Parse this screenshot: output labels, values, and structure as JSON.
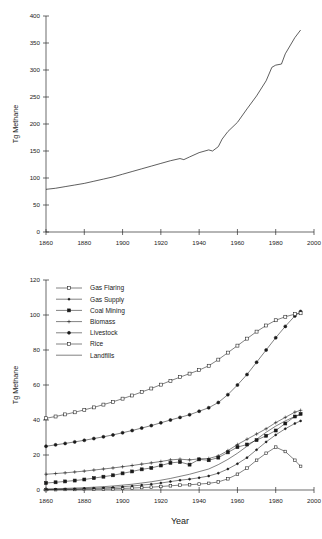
{
  "figure": {
    "axis_title_y": "Tg Methane",
    "axis_title_x": "Year"
  },
  "chart_data": [
    {
      "type": "line",
      "title": "",
      "xlabel": "",
      "ylabel": "Tg Methane",
      "xlim": [
        1860,
        2000
      ],
      "ylim": [
        0,
        400
      ],
      "xticks": [
        1860,
        1880,
        1900,
        1920,
        1940,
        1960,
        1980,
        2000
      ],
      "yticks": [
        0,
        50,
        100,
        150,
        200,
        250,
        300,
        350,
        400
      ],
      "grid": false,
      "legend": "none",
      "series": [
        {
          "name": "Total anthropogenic methane",
          "x": [
            1860,
            1865,
            1870,
            1875,
            1880,
            1885,
            1890,
            1895,
            1900,
            1905,
            1910,
            1915,
            1920,
            1925,
            1930,
            1932,
            1935,
            1940,
            1945,
            1947,
            1950,
            1952,
            1955,
            1960,
            1965,
            1970,
            1975,
            1978,
            1980,
            1983,
            1985,
            1990,
            1993
          ],
          "values": [
            79,
            81,
            84,
            87,
            90,
            94,
            98,
            102,
            107,
            112,
            117,
            122,
            127,
            132,
            136,
            134,
            139,
            147,
            152,
            150,
            158,
            172,
            186,
            203,
            228,
            252,
            280,
            305,
            309,
            311,
            330,
            360,
            374
          ]
        }
      ]
    },
    {
      "type": "line",
      "title": "",
      "xlabel": "Year",
      "ylabel": "Tg Methane",
      "xlim": [
        1860,
        2000
      ],
      "ylim": [
        0,
        120
      ],
      "xticks": [
        1860,
        1880,
        1900,
        1920,
        1940,
        1960,
        1980,
        2000
      ],
      "yticks": [
        0,
        20,
        40,
        60,
        80,
        100,
        120
      ],
      "grid": false,
      "legend": "upper left",
      "categories": [
        1860,
        1865,
        1870,
        1875,
        1880,
        1885,
        1890,
        1895,
        1900,
        1905,
        1910,
        1915,
        1920,
        1925,
        1930,
        1935,
        1940,
        1945,
        1950,
        1955,
        1960,
        1965,
        1970,
        1975,
        1980,
        1985,
        1990,
        1993
      ],
      "series": [
        {
          "name": "Gas Flaring",
          "marker": "open-square",
          "values": [
            0.2,
            0.2,
            0.3,
            0.3,
            0.4,
            0.5,
            0.6,
            0.7,
            0.9,
            1.1,
            1.4,
            1.6,
            2.0,
            2.4,
            2.8,
            3.0,
            3.4,
            3.8,
            4.6,
            6.4,
            9.0,
            12.5,
            17.0,
            21.0,
            24.5,
            22.0,
            17.0,
            13.5
          ]
        },
        {
          "name": "Gas Supply",
          "marker": "small-dot",
          "values": [
            0.3,
            0.4,
            0.5,
            0.6,
            0.8,
            1.0,
            1.2,
            1.5,
            1.9,
            2.3,
            2.8,
            3.3,
            4.0,
            4.8,
            5.6,
            6.2,
            7.0,
            8.0,
            9.6,
            12.0,
            15.0,
            18.5,
            23.0,
            27.5,
            31.5,
            35.0,
            38.0,
            39.5
          ]
        },
        {
          "name": "Coal Mining",
          "marker": "filled-square",
          "values": [
            4.0,
            4.4,
            4.9,
            5.4,
            6.0,
            6.8,
            7.6,
            8.4,
            9.5,
            10.6,
            11.8,
            12.6,
            14.0,
            15.5,
            16.0,
            14.5,
            17.5,
            17.0,
            18.5,
            21.5,
            24.5,
            26.0,
            28.5,
            31.0,
            34.0,
            38.0,
            42.0,
            43.5
          ]
        },
        {
          "name": "Biomass",
          "marker": "plus",
          "values": [
            9.0,
            9.4,
            9.8,
            10.3,
            10.8,
            11.4,
            12.0,
            12.6,
            13.3,
            14.0,
            14.8,
            15.5,
            16.3,
            17.2,
            17.6,
            17.2,
            17.8,
            18.0,
            19.5,
            22.5,
            26.0,
            29.0,
            32.0,
            35.0,
            38.5,
            41.5,
            44.5,
            45.5
          ]
        },
        {
          "name": "Livestock",
          "marker": "filled-circle",
          "values": [
            25.0,
            25.8,
            26.6,
            27.5,
            28.4,
            29.4,
            30.4,
            31.5,
            32.7,
            34.0,
            35.4,
            36.8,
            38.4,
            40.0,
            41.5,
            43.0,
            45.0,
            47.0,
            50.0,
            54.5,
            60.0,
            66.0,
            73.0,
            80.0,
            87.0,
            93.5,
            99.5,
            102.0
          ]
        },
        {
          "name": "Rice",
          "marker": "open-square-lg",
          "values": [
            41.0,
            42.0,
            43.2,
            44.4,
            45.8,
            47.2,
            48.8,
            50.4,
            52.2,
            54.0,
            56.0,
            58.0,
            60.2,
            62.4,
            64.5,
            66.5,
            68.5,
            71.0,
            74.5,
            78.5,
            82.5,
            86.5,
            90.5,
            94.0,
            97.0,
            99.0,
            100.5,
            101.0
          ]
        },
        {
          "name": "Landfills",
          "marker": "none",
          "values": [
            0.6,
            0.7,
            0.9,
            1.1,
            1.3,
            1.6,
            1.9,
            2.3,
            2.8,
            3.3,
            4.0,
            4.7,
            5.6,
            6.6,
            7.8,
            9.0,
            10.5,
            12.0,
            14.5,
            17.5,
            21.0,
            25.0,
            29.0,
            33.0,
            36.5,
            39.5,
            42.0,
            43.0
          ]
        }
      ]
    }
  ]
}
